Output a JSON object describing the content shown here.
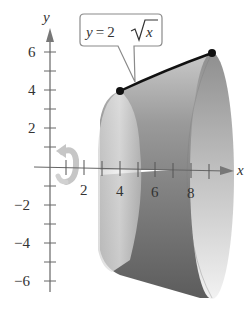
{
  "figure": {
    "type": "solid-of-revolution",
    "axes": {
      "x_label": "x",
      "y_label": "y",
      "x_ticks": [
        "2",
        "4",
        "6",
        "8"
      ],
      "y_ticks": [
        "6",
        "4",
        "2",
        "-2",
        "-4",
        "-6"
      ]
    },
    "callout": {
      "lhs": "y = 2",
      "radical": "x",
      "text": "y = 2√x"
    },
    "curve": {
      "equation": "y = 2√x",
      "start_point": [
        4,
        4
      ],
      "end_point": [
        9,
        6
      ]
    },
    "rotation_axis": "x-axis",
    "rotation_icon": "rotation-arrow-icon",
    "colors": {
      "curve": "#111111",
      "solid_light": "#e6e6e6",
      "solid_mid": "#a8a8a8",
      "solid_dark": "#6e6e6e",
      "axis": "#555555"
    }
  }
}
